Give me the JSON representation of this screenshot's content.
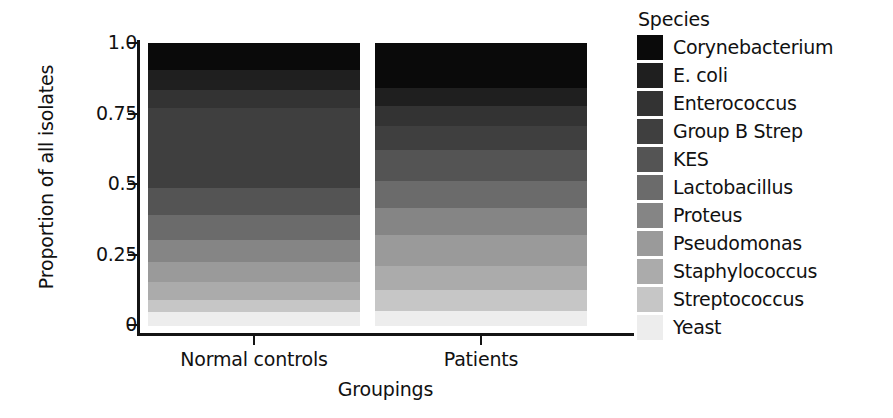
{
  "chart_data": {
    "type": "bar",
    "subtype": "stacked-proportional",
    "title": "",
    "xlabel": "Groupings",
    "ylabel": "Proportion of all isolates",
    "categories": [
      "Normal controls",
      "Patients"
    ],
    "ylim": [
      0,
      1.0
    ],
    "ytick_labels": [
      "0",
      "0.25",
      "0.5",
      "0.75",
      "1.0"
    ],
    "ytick_values": [
      0,
      0.25,
      0.5,
      0.75,
      1.0
    ],
    "grid": false,
    "legend_title": "Species",
    "legend_position": "right",
    "stack_order_bottom_to_top": [
      "Yeast",
      "Streptococcus",
      "Staphylococcus",
      "Pseudomonas",
      "Proteus",
      "Lactobacillus",
      "KES",
      "Group B Strep",
      "Enterococcus",
      "E. coli",
      "Corynebacterium"
    ],
    "series": [
      {
        "name": "Corynebacterium",
        "color": "#0a0a0a",
        "values": [
          0.095,
          0.16
        ]
      },
      {
        "name": "E. coli",
        "color": "#1f1f1f",
        "values": [
          0.07,
          0.065
        ]
      },
      {
        "name": "Enterococcus",
        "color": "#333333",
        "values": [
          0.065,
          0.07
        ]
      },
      {
        "name": "Group B Strep",
        "color": "#3f3f3f",
        "values": [
          0.285,
          0.085
        ]
      },
      {
        "name": "KES",
        "color": "#545454",
        "values": [
          0.095,
          0.11
        ]
      },
      {
        "name": "Lactobacillus",
        "color": "#6b6b6b",
        "values": [
          0.09,
          0.095
        ]
      },
      {
        "name": "Proteus",
        "color": "#858585",
        "values": [
          0.077,
          0.095
        ]
      },
      {
        "name": "Pseudomonas",
        "color": "#9a9a9a",
        "values": [
          0.071,
          0.11
        ]
      },
      {
        "name": "Staphylococcus",
        "color": "#ababab",
        "values": [
          0.063,
          0.085
        ]
      },
      {
        "name": "Streptococcus",
        "color": "#c6c6c6",
        "values": [
          0.043,
          0.075
        ]
      },
      {
        "name": "Yeast",
        "color": "#ededed",
        "values": [
          0.046,
          0.05
        ]
      }
    ]
  },
  "axes": {
    "y_title": "Proportion of all isolates",
    "x_title": "Groupings",
    "y_ticks": [
      "1.0",
      "0.75",
      "0.5",
      "0.25",
      "0"
    ],
    "x_ticks": [
      "Normal controls",
      "Patients"
    ]
  },
  "legend": {
    "title": "Species",
    "items": [
      {
        "label": "Corynebacterium",
        "color": "#0a0a0a"
      },
      {
        "label": "E. coli",
        "color": "#1f1f1f"
      },
      {
        "label": "Enterococcus",
        "color": "#333333"
      },
      {
        "label": "Group B Strep",
        "color": "#3f3f3f"
      },
      {
        "label": "KES",
        "color": "#545454"
      },
      {
        "label": "Lactobacillus",
        "color": "#6b6b6b"
      },
      {
        "label": "Proteus",
        "color": "#858585"
      },
      {
        "label": "Pseudomonas",
        "color": "#9a9a9a"
      },
      {
        "label": "Staphylococcus",
        "color": "#ababab"
      },
      {
        "label": "Streptococcus",
        "color": "#c6c6c6"
      },
      {
        "label": "Yeast",
        "color": "#ededed"
      }
    ]
  },
  "colors": {
    "axis": "#141414",
    "text": "#111111",
    "background": "#ffffff"
  }
}
